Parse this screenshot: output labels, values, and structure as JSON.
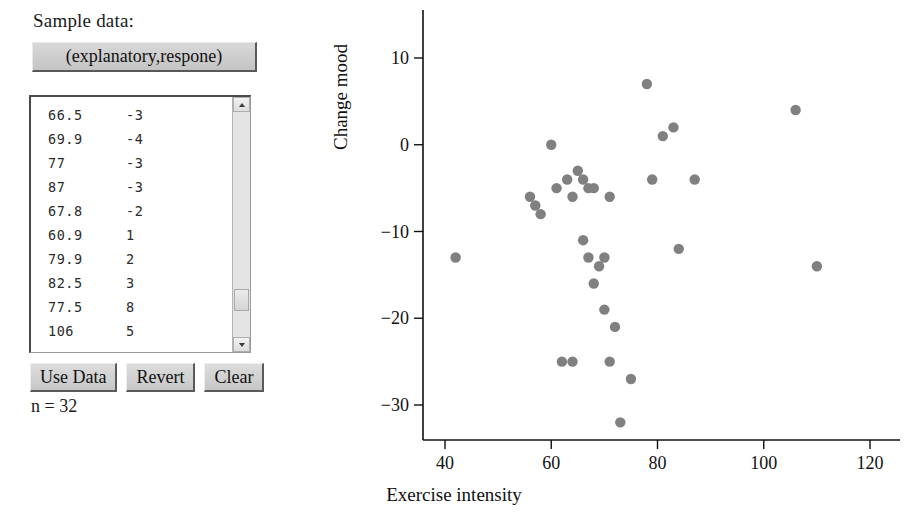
{
  "panel": {
    "sample_data_label": "Sample data:",
    "header_button_label": "(explanatory,respone)",
    "n_label": "n = 32",
    "buttons": [
      {
        "label": "Use Data"
      },
      {
        "label": "Revert"
      },
      {
        "label": "Clear"
      }
    ],
    "visible_rows": [
      {
        "x": "66.5",
        "y": "-3"
      },
      {
        "x": "69.9",
        "y": "-4"
      },
      {
        "x": "77",
        "y": "-3"
      },
      {
        "x": "87",
        "y": "-3"
      },
      {
        "x": "67.8",
        "y": "-2"
      },
      {
        "x": "60.9",
        "y": "1"
      },
      {
        "x": "79.9",
        "y": "2"
      },
      {
        "x": "82.5",
        "y": "3"
      },
      {
        "x": "77.5",
        "y": "8"
      },
      {
        "x": "106",
        "y": "5"
      }
    ]
  },
  "colors": {
    "point": "#808080",
    "axis": "#111111",
    "button_face": "#d0d0d0"
  },
  "chart_data": {
    "type": "scatter",
    "title": "",
    "xlabel": "Exercise intensity",
    "ylabel": "Change mood",
    "xlim": [
      33,
      126
    ],
    "ylim": [
      -34,
      13
    ],
    "xticks": [
      40,
      60,
      80,
      100,
      120
    ],
    "yticks": [
      10,
      0,
      -10,
      -20,
      -30
    ],
    "grid": false,
    "legend": false,
    "n": 32,
    "points": [
      {
        "x": 42,
        "y": -13
      },
      {
        "x": 56,
        "y": -6
      },
      {
        "x": 57,
        "y": -7
      },
      {
        "x": 58,
        "y": -8
      },
      {
        "x": 60,
        "y": 0
      },
      {
        "x": 61,
        "y": -5
      },
      {
        "x": 62,
        "y": -25
      },
      {
        "x": 63,
        "y": -4
      },
      {
        "x": 64,
        "y": -25
      },
      {
        "x": 64,
        "y": -6
      },
      {
        "x": 65,
        "y": -3
      },
      {
        "x": 66,
        "y": -4
      },
      {
        "x": 66,
        "y": -11
      },
      {
        "x": 67,
        "y": -5
      },
      {
        "x": 67,
        "y": -13
      },
      {
        "x": 68,
        "y": -16
      },
      {
        "x": 68,
        "y": -5
      },
      {
        "x": 69,
        "y": -14
      },
      {
        "x": 70,
        "y": -13
      },
      {
        "x": 70,
        "y": -19
      },
      {
        "x": 71,
        "y": -25
      },
      {
        "x": 71,
        "y": -6
      },
      {
        "x": 72,
        "y": -21
      },
      {
        "x": 73,
        "y": -32
      },
      {
        "x": 75,
        "y": -27
      },
      {
        "x": 78,
        "y": 7
      },
      {
        "x": 79,
        "y": -4
      },
      {
        "x": 81,
        "y": 1
      },
      {
        "x": 83,
        "y": 2
      },
      {
        "x": 84,
        "y": -12
      },
      {
        "x": 87,
        "y": -4
      },
      {
        "x": 106,
        "y": 4
      },
      {
        "x": 110,
        "y": -14
      }
    ]
  }
}
